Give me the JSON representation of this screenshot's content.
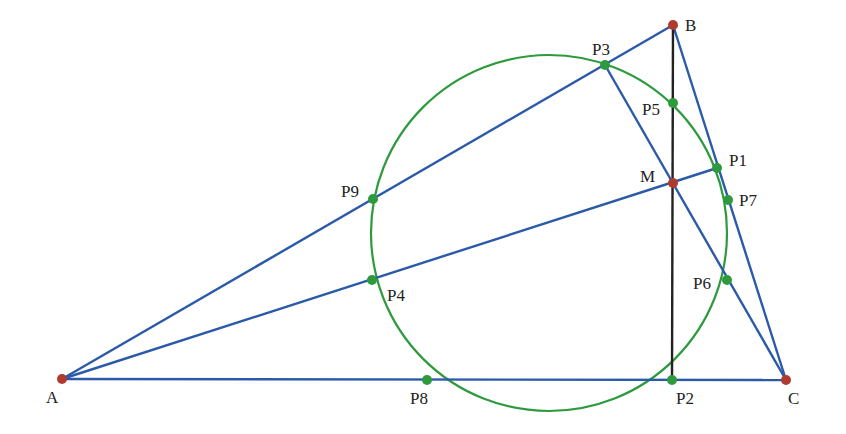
{
  "diagram": {
    "type": "geometry",
    "colors": {
      "segment": "#2b5aa8",
      "altitude": "#222222",
      "circle": "#2e9a3e",
      "vertex": "#b03a2e",
      "point": "#2e9a3e"
    },
    "circle": {
      "cx": 549,
      "cy": 233,
      "r": 178
    },
    "labels": {
      "A": "A",
      "B": "B",
      "C": "C",
      "M": "M",
      "P1": "P1",
      "P2": "P2",
      "P3": "P3",
      "P4": "P4",
      "P5": "P5",
      "P6": "P6",
      "P7": "P7",
      "P8": "P8",
      "P9": "P9"
    },
    "vertices": [
      {
        "name": "A",
        "x": 62,
        "y": 379
      },
      {
        "name": "B",
        "x": 673,
        "y": 25
      },
      {
        "name": "C",
        "x": 786,
        "y": 380
      },
      {
        "name": "M",
        "x": 673,
        "y": 183
      }
    ],
    "points": [
      {
        "name": "P1",
        "x": 717,
        "y": 168
      },
      {
        "name": "P2",
        "x": 672,
        "y": 380
      },
      {
        "name": "P3",
        "x": 605,
        "y": 65
      },
      {
        "name": "P4",
        "x": 372,
        "y": 280
      },
      {
        "name": "P5",
        "x": 673,
        "y": 103
      },
      {
        "name": "P6",
        "x": 727,
        "y": 280
      },
      {
        "name": "P7",
        "x": 728,
        "y": 200
      },
      {
        "name": "P8",
        "x": 427,
        "y": 380
      },
      {
        "name": "P9",
        "x": 373,
        "y": 199
      }
    ]
  }
}
